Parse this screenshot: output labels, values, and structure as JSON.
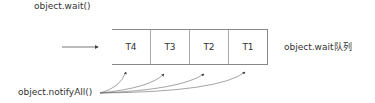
{
  "diagram": {
    "wait_label": "object.wait()",
    "queue_label": "object.wait队列",
    "notify_label": "object.notifyAll()",
    "queue_cells": [
      "T4",
      "T3",
      "T2",
      "T1"
    ],
    "colors": {
      "line": "#555555",
      "text": "#333333",
      "box_border": "#888888"
    }
  }
}
